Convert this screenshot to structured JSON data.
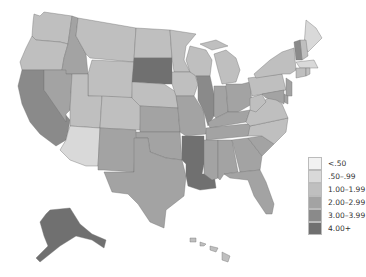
{
  "legend": {
    "items": [
      {
        "label": "<.50",
        "color": "#f2f2f2"
      },
      {
        "label": ".50–.99",
        "color": "#d9d9d9"
      },
      {
        "label": "1.00–1.99",
        "color": "#bfbfbf"
      },
      {
        "label": "2.00–2.99",
        "color": "#a3a3a3"
      },
      {
        "label": "3.00–3.99",
        "color": "#8a8a8a"
      },
      {
        "label": "4.00+",
        "color": "#707070"
      }
    ]
  },
  "states": {
    "WA": 2,
    "OR": 2,
    "CA": 4,
    "ID": 3,
    "NV": 3,
    "MT": 2,
    "WY": 2,
    "UT": 2,
    "AZ": 1,
    "CO": 2,
    "NM": 3,
    "ND": 2,
    "SD": 5,
    "NE": 2,
    "KS": 3,
    "OK": 3,
    "TX": 3,
    "MN": 2,
    "IA": 2,
    "MO": 3,
    "AR": 5,
    "LA": 5,
    "WI": 2,
    "IL": 4,
    "MI": 2,
    "IN": 3,
    "OH": 3,
    "KY": 3,
    "TN": 3,
    "MS": 3,
    "AL": 3,
    "GA": 3,
    "FL": 3,
    "SC": 3,
    "NC": 2,
    "VA": 2,
    "WV": 2,
    "PA": 2,
    "NY": 2,
    "ME": 1,
    "NH": 2,
    "VT": 4,
    "MA": 1,
    "CT": 2,
    "RI": 2,
    "NJ": 3,
    "DE": 3,
    "MD": 3,
    "AK": 5,
    "HI": 2
  }
}
